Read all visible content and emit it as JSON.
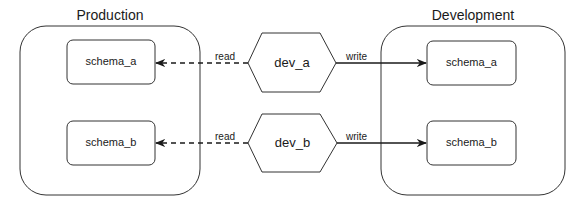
{
  "diagram": {
    "containers": [
      {
        "id": "production",
        "title": "Production",
        "schemas": [
          {
            "id": "prod-schema-a",
            "label": "schema_a"
          },
          {
            "id": "prod-schema-b",
            "label": "schema_b"
          }
        ]
      },
      {
        "id": "development",
        "title": "Development",
        "schemas": [
          {
            "id": "dev-schema-a",
            "label": "schema_a"
          },
          {
            "id": "dev-schema-b",
            "label": "schema_b"
          }
        ]
      }
    ],
    "processes": [
      {
        "id": "dev_a",
        "label": "dev_a",
        "read_label": "read",
        "write_label": "write"
      },
      {
        "id": "dev_b",
        "label": "dev_b",
        "read_label": "read",
        "write_label": "write"
      }
    ],
    "edges": [
      {
        "from": "dev_a",
        "to": "Production.schema_a",
        "label": "read",
        "style": "dashed"
      },
      {
        "from": "dev_a",
        "to": "Development.schema_a",
        "label": "write",
        "style": "solid"
      },
      {
        "from": "dev_b",
        "to": "Production.schema_b",
        "label": "read",
        "style": "dashed"
      },
      {
        "from": "dev_b",
        "to": "Development.schema_b",
        "label": "write",
        "style": "solid"
      }
    ],
    "colors": {
      "stroke": "#333333",
      "background": "#ffffff",
      "text": "#1a1a1a"
    }
  }
}
